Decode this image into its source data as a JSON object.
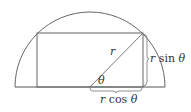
{
  "diagram": {
    "type": "geometry",
    "labels": {
      "radius": "r",
      "angle": "θ",
      "height": "r sin θ",
      "half_width": "r cos θ"
    },
    "height_label_parts": {
      "var": "r",
      "func": " sin ",
      "angle": "θ"
    },
    "width_label_parts": {
      "var": "r",
      "func": " cos ",
      "angle": "θ"
    },
    "colors": {
      "stroke": "#666666",
      "text": "#333333",
      "background": "#ffffff"
    }
  }
}
